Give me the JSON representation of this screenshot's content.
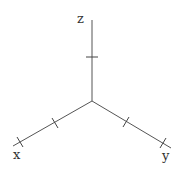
{
  "diagram": {
    "type": "3d-coordinate-axes",
    "origin": [
      92,
      101
    ],
    "axes": [
      {
        "name": "x",
        "label": "x",
        "end": [
          13,
          146
        ],
        "ticks": [
          [
            55,
            123
          ],
          [
            20,
            142
          ]
        ],
        "label_pos": [
          13,
          159
        ]
      },
      {
        "name": "y",
        "label": "y",
        "end": [
          171,
          148
        ],
        "ticks": [
          [
            126,
            122
          ],
          [
            163,
            143
          ]
        ],
        "label_pos": [
          162,
          160
        ]
      },
      {
        "name": "z",
        "label": "z",
        "end": [
          92,
          20
        ],
        "ticks": [
          [
            92,
            57
          ]
        ],
        "label_pos": [
          77,
          23
        ]
      }
    ],
    "colors": {
      "axis": "#555555",
      "label": "#333333",
      "background": "#ffffff"
    }
  }
}
